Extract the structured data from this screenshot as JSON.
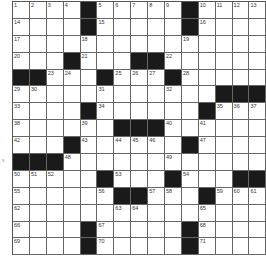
{
  "puzzle": {
    "rows": 15,
    "cols": 15,
    "grid": [
      [
        "1",
        "2",
        "3",
        "4",
        "#",
        "5",
        "6",
        "7",
        "8",
        "9",
        "#",
        "10",
        "11",
        "12",
        "13"
      ],
      [
        "14",
        "",
        "",
        "",
        "#",
        "15",
        "",
        "",
        "",
        "",
        "#",
        "16",
        "",
        "",
        ""
      ],
      [
        "17",
        "",
        "",
        "",
        "18",
        "",
        "",
        "",
        "",
        "",
        "19",
        "",
        "",
        "",
        ""
      ],
      [
        "20",
        "",
        "",
        "#",
        "21",
        "",
        "",
        "#",
        "#",
        "22",
        "",
        "",
        "",
        "",
        ""
      ],
      [
        "#",
        "#",
        "23",
        "24",
        "",
        "#",
        "25",
        "26",
        "27",
        "#",
        "28",
        "",
        "",
        "",
        ""
      ],
      [
        "29",
        "30",
        "",
        "",
        "",
        "31",
        "",
        "",
        "",
        "32",
        "",
        "",
        "#",
        "#",
        "#"
      ],
      [
        "33",
        "",
        "",
        "",
        "#",
        "34",
        "",
        "",
        "",
        "",
        "",
        "#",
        "35",
        "36",
        "37"
      ],
      [
        "38",
        "",
        "",
        "",
        "39",
        "",
        "#",
        "#",
        "#",
        "40",
        "",
        "41",
        "",
        "",
        ""
      ],
      [
        "42",
        "",
        "",
        "#",
        "43",
        "",
        "44",
        "45",
        "46",
        "",
        "#",
        "47",
        "",
        "",
        ""
      ],
      [
        "#",
        "#",
        "#",
        "48",
        "",
        "",
        "",
        "",
        "",
        "49",
        "",
        "",
        "",
        "",
        ""
      ],
      [
        "50",
        "51",
        "52",
        "",
        "",
        "#",
        "53",
        "",
        "",
        "#",
        "54",
        "",
        "",
        "#",
        "#"
      ],
      [
        "55",
        "",
        "",
        "",
        "",
        "56",
        "#",
        "#",
        "57",
        "58",
        "",
        "#",
        "59",
        "60",
        "61"
      ],
      [
        "62",
        "",
        "",
        "",
        "",
        "",
        "63",
        "64",
        "",
        "",
        "",
        "65",
        "",
        "",
        ""
      ],
      [
        "66",
        "",
        "",
        "",
        "#",
        "67",
        "",
        "",
        "",
        "",
        "#",
        "68",
        "",
        "",
        ""
      ],
      [
        "69",
        "",
        "",
        "",
        "#",
        "70",
        "",
        "",
        "",
        "",
        "#",
        "71",
        "",
        "",
        ""
      ]
    ]
  },
  "margin_mark": "s"
}
